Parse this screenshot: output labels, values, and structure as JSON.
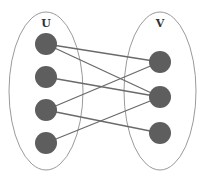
{
  "diagram": {
    "type": "bipartite-graph",
    "sets": [
      {
        "id": "U",
        "label": "U",
        "cx": 46,
        "cy": 91,
        "rx": 37,
        "ry": 79,
        "label_x": 46,
        "label_y": 27
      },
      {
        "id": "V",
        "label": "V",
        "cx": 160,
        "cy": 91,
        "rx": 36,
        "ry": 79,
        "label_x": 160,
        "label_y": 27
      }
    ],
    "nodes": [
      {
        "id": "u1",
        "set": "U",
        "x": 46,
        "y": 44
      },
      {
        "id": "u2",
        "set": "U",
        "x": 46,
        "y": 77
      },
      {
        "id": "u3",
        "set": "U",
        "x": 46,
        "y": 110
      },
      {
        "id": "u4",
        "set": "U",
        "x": 46,
        "y": 143
      },
      {
        "id": "v1",
        "set": "V",
        "x": 160,
        "y": 62
      },
      {
        "id": "v2",
        "set": "V",
        "x": 160,
        "y": 97
      },
      {
        "id": "v3",
        "set": "V",
        "x": 160,
        "y": 133
      }
    ],
    "edges": [
      {
        "from": "u1",
        "to": "v1"
      },
      {
        "from": "u1",
        "to": "v2"
      },
      {
        "from": "u2",
        "to": "v2"
      },
      {
        "from": "u3",
        "to": "v1"
      },
      {
        "from": "u3",
        "to": "v3"
      },
      {
        "from": "u4",
        "to": "v2"
      }
    ],
    "node_radius": 11,
    "colors": {
      "node": "#5e5e5e",
      "edge": "#6a6a6a",
      "outline": "#9a9a9a",
      "label": "#333333"
    }
  }
}
